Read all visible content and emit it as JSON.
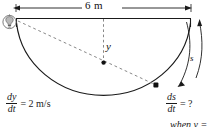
{
  "figure": {
    "dimension_label": "6 m",
    "variable_y": "y",
    "variable_s": "s",
    "colors": {
      "stroke": "#1a1a1a",
      "dashed": "#7a7a7a",
      "background": "#ffffff"
    }
  },
  "equations": {
    "left": {
      "numerator": "dy",
      "denominator": "dt",
      "relation": "= 2 m/s"
    },
    "right": {
      "numerator": "ds",
      "denominator": "dt",
      "relation": "= ?",
      "condition": "when y ="
    }
  },
  "icons": {
    "lamp": "lamp-icon"
  }
}
